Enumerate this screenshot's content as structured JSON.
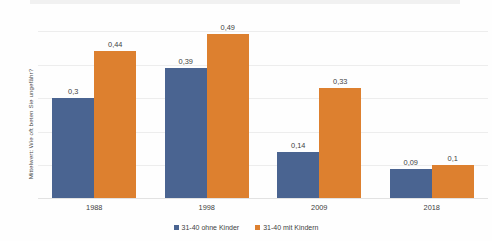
{
  "chart_data": {
    "type": "bar",
    "title": "",
    "xlabel": "",
    "ylabel": "Mittelwert: Wie oft beten Sie ungefähr?",
    "categories": [
      "1988",
      "1998",
      "2009",
      "2018"
    ],
    "series": [
      {
        "name": "31-40 ohne Kinder",
        "color": "#4a6491",
        "values": [
          0.3,
          0.39,
          0.14,
          0.09
        ],
        "labels": [
          "0,3",
          "0,39",
          "0,14",
          "0,09"
        ]
      },
      {
        "name": "31-40 mit Kindern",
        "color": "#dd802f",
        "values": [
          0.44,
          0.49,
          0.33,
          0.1
        ],
        "labels": [
          "0,44",
          "0,49",
          "0,33",
          "0,1"
        ]
      }
    ],
    "ylim": [
      0,
      0.5
    ],
    "y_gridline_values": [
      0.1,
      0.2,
      0.3,
      0.4,
      0.5
    ],
    "y_tick_labels_visible": false,
    "grid": true,
    "legend_position": "bottom"
  },
  "legend": {
    "items": [
      {
        "label": "31-40 ohne Kinder",
        "color": "#4a6491"
      },
      {
        "label": "31-40 mit Kindern",
        "color": "#dd802f"
      }
    ]
  }
}
